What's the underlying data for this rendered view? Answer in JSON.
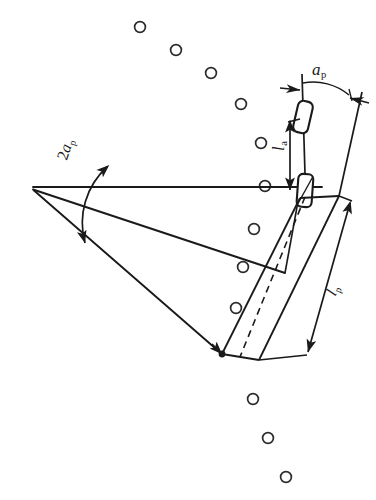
{
  "figure": {
    "type": "technical-line-diagram",
    "background_color": "#ffffff",
    "line_color": "#1a1a1a",
    "canvas": {
      "width": 376,
      "height": 500
    }
  },
  "labels": {
    "angle_half_label": {
      "symbol": "a",
      "subscript": "p",
      "text": "ap"
    },
    "angle_full_label": {
      "prefix": "2",
      "symbol": "a",
      "subscript": "p",
      "text": "2ap"
    },
    "length_a_label": {
      "symbol": "l",
      "subscript": "a",
      "text": "la"
    },
    "length_p_label": {
      "symbol": "l",
      "subscript": "p",
      "text": "lp"
    }
  },
  "geometry": {
    "apex": {
      "x": 33,
      "y": 188
    },
    "horizontal_line": {
      "x1": 33,
      "y1": 188,
      "x2": 322,
      "y2": 188
    },
    "fan_line_mid": {
      "x1": 33,
      "y1": 188,
      "x2": 281,
      "y2": 272
    },
    "fan_line_lower": {
      "x1": 33,
      "y1": 188,
      "x2": 222,
      "y2": 354
    },
    "arc_2ap": {
      "cx": 33,
      "cy": 188,
      "radius": 76,
      "start_deg": -16,
      "end_deg": 42
    },
    "pivot_pad_upper": {
      "cx": 303,
      "cy": 117,
      "w": 15,
      "h": 30,
      "rotate_deg": 13
    },
    "pivot_pad_lower": {
      "cx": 305,
      "cy": 190,
      "w": 14,
      "h": 30,
      "rotate_deg": 5
    },
    "vertical_reference": {
      "x1": 303,
      "y1": 76,
      "x2": 306,
      "y2": 205
    },
    "arm_edge_left": {
      "x1": 299,
      "y1": 196,
      "x2": 222,
      "y2": 354
    },
    "arm_edge_right": {
      "x1": 337,
      "y1": 196,
      "x2": 259,
      "y2": 360
    },
    "arm_centerline_dashed": {
      "x1": 303,
      "y1": 196,
      "x2": 240,
      "y2": 357
    },
    "dimension_arrow_la": {
      "x": 290,
      "y_top": 124,
      "y_bottom": 190
    },
    "dimension_arrow_lp": {
      "x1": 348,
      "y1": 206,
      "x2": 307,
      "y2": 352
    },
    "angle_arrow_left": {
      "x": 293,
      "y": 90
    },
    "angle_arrow_right": {
      "x": 347,
      "y": 97
    }
  },
  "circles": {
    "count": 11,
    "radius": 5.4,
    "stroke_width": 1.6,
    "points": [
      {
        "x": 140,
        "y": 27
      },
      {
        "x": 176,
        "y": 50
      },
      {
        "x": 211,
        "y": 73
      },
      {
        "x": 241,
        "y": 104
      },
      {
        "x": 261,
        "y": 143
      },
      {
        "x": 265,
        "y": 186
      },
      {
        "x": 254,
        "y": 229
      },
      {
        "x": 243,
        "y": 267
      },
      {
        "x": 236,
        "y": 308
      },
      {
        "x": 253,
        "y": 399
      },
      {
        "x": 268,
        "y": 438
      },
      {
        "x": 286,
        "y": 477
      }
    ]
  }
}
